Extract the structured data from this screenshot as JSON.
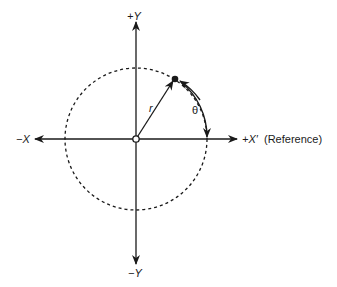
{
  "diagram": {
    "type": "polar-coordinate-system",
    "axes": {
      "pos_y": "+Y",
      "neg_y": "−Y",
      "neg_x": "−X",
      "pos_x": "+X′",
      "pos_x_note": "(Reference)"
    },
    "radius_label": "r",
    "angle_label": "θ",
    "colors": {
      "stroke": "#1a1a1a",
      "background": "#ffffff"
    }
  }
}
